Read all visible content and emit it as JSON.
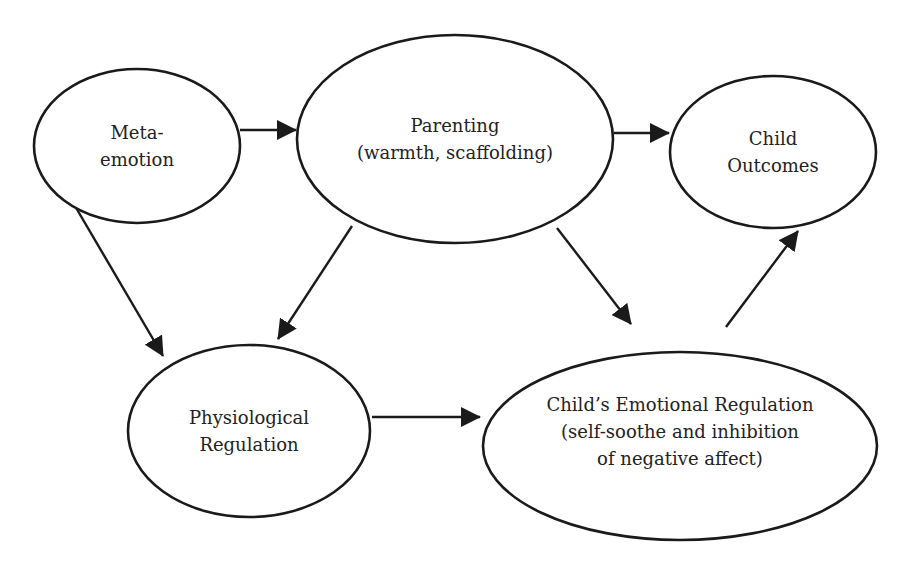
{
  "diagram": {
    "type": "flow-model",
    "colors": {
      "stroke": "#1a1a1a",
      "text": "#222222",
      "background": "#ffffff"
    },
    "nodes": [
      {
        "id": "meta",
        "lines": [
          "Meta-",
          "emotion"
        ],
        "cx": 137,
        "cy": 146,
        "rx": 103,
        "ry": 77
      },
      {
        "id": "parent",
        "lines": [
          "Parenting",
          "(warmth, scaffolding)"
        ],
        "cx": 455,
        "cy": 139,
        "rx": 158,
        "ry": 104
      },
      {
        "id": "out",
        "lines": [
          "Child",
          "Outcomes"
        ],
        "cx": 773,
        "cy": 152,
        "rx": 103,
        "ry": 76
      },
      {
        "id": "phys",
        "lines": [
          "Physiological",
          "Regulation"
        ],
        "cx": 249,
        "cy": 431,
        "rx": 121,
        "ry": 86
      },
      {
        "id": "er",
        "lines": [
          "Child’s Emotional Regulation",
          "(self-soothe and inhibition",
          "of negative affect)"
        ],
        "cx": 680,
        "cy": 446,
        "rx": 197,
        "ry": 94
      }
    ],
    "edges": [
      {
        "from": "meta",
        "to": "parent",
        "x1": 240,
        "y1": 130,
        "x2": 296,
        "y2": 130
      },
      {
        "from": "parent",
        "to": "out",
        "x1": 614,
        "y1": 133,
        "x2": 669,
        "y2": 133
      },
      {
        "from": "meta",
        "to": "phys",
        "x1": 75,
        "y1": 206,
        "x2": 163,
        "y2": 356
      },
      {
        "from": "parent",
        "to": "phys",
        "x1": 352,
        "y1": 226,
        "x2": 278,
        "y2": 339
      },
      {
        "from": "parent",
        "to": "er",
        "x1": 557,
        "y1": 228,
        "x2": 631,
        "y2": 324
      },
      {
        "from": "phys",
        "to": "er",
        "x1": 372,
        "y1": 417,
        "x2": 480,
        "y2": 417
      },
      {
        "from": "er",
        "to": "out",
        "x1": 726,
        "y1": 327,
        "x2": 798,
        "y2": 231
      }
    ]
  }
}
